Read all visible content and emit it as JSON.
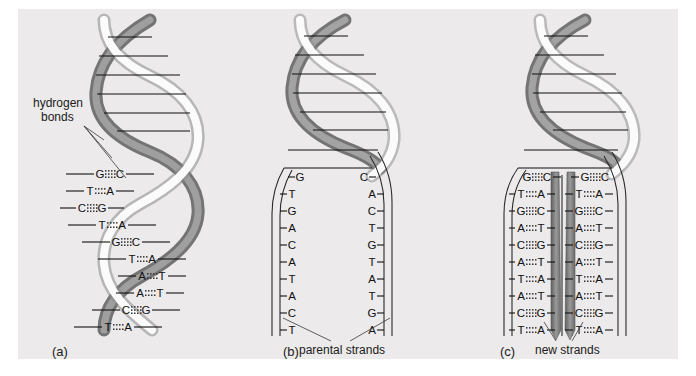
{
  "figure": {
    "background_color": "#ffffff",
    "plate_color": "#eceaea",
    "line_color": "#1a1a1a"
  },
  "annotations": {
    "hydrogen_bonds_line1": "hydrogen",
    "hydrogen_bonds_line2": "bonds",
    "parental_strands": "parental strands",
    "new_strands": "new strands"
  },
  "panels": [
    {
      "id": "a",
      "label": "(a)",
      "state": "intact double helix",
      "base_pairs": [
        {
          "left": "G",
          "right": "C",
          "bonds": 3
        },
        {
          "left": "T",
          "right": "A",
          "bonds": 2
        },
        {
          "left": "C",
          "right": "G",
          "bonds": 3
        },
        {
          "left": "T",
          "right": "A",
          "bonds": 2
        },
        {
          "left": "G",
          "right": "C",
          "bonds": 3
        },
        {
          "left": "T",
          "right": "A",
          "bonds": 2
        },
        {
          "left": "A",
          "right": "T",
          "bonds": 2
        },
        {
          "left": "A",
          "right": "T",
          "bonds": 2
        },
        {
          "left": "C",
          "right": "G",
          "bonds": 3
        },
        {
          "left": "T",
          "right": "A",
          "bonds": 2
        }
      ]
    },
    {
      "id": "b",
      "label": "(b)",
      "state": "unwound parental strands",
      "left_strand": [
        "G",
        "T",
        "G",
        "A",
        "C",
        "A",
        "T",
        "A",
        "C",
        "T"
      ],
      "right_strand": [
        "C",
        "A",
        "C",
        "T",
        "G",
        "T",
        "A",
        "T",
        "G",
        "A"
      ]
    },
    {
      "id": "c",
      "label": "(c)",
      "state": "two new daughter duplexes",
      "duplex_left": [
        {
          "left": "G",
          "right": "C",
          "bonds": 3
        },
        {
          "left": "T",
          "right": "A",
          "bonds": 2
        },
        {
          "left": "G",
          "right": "C",
          "bonds": 3
        },
        {
          "left": "A",
          "right": "T",
          "bonds": 2
        },
        {
          "left": "C",
          "right": "G",
          "bonds": 3
        },
        {
          "left": "A",
          "right": "T",
          "bonds": 2
        },
        {
          "left": "T",
          "right": "A",
          "bonds": 2
        },
        {
          "left": "A",
          "right": "T",
          "bonds": 2
        },
        {
          "left": "C",
          "right": "G",
          "bonds": 3
        },
        {
          "left": "T",
          "right": "A",
          "bonds": 2
        }
      ],
      "duplex_right": [
        {
          "left": "G",
          "right": "C",
          "bonds": 3
        },
        {
          "left": "T",
          "right": "A",
          "bonds": 2
        },
        {
          "left": "G",
          "right": "C",
          "bonds": 3
        },
        {
          "left": "A",
          "right": "T",
          "bonds": 2
        },
        {
          "left": "C",
          "right": "G",
          "bonds": 3
        },
        {
          "left": "A",
          "right": "T",
          "bonds": 2
        },
        {
          "left": "T",
          "right": "A",
          "bonds": 2
        },
        {
          "left": "A",
          "right": "T",
          "bonds": 2
        },
        {
          "left": "C",
          "right": "G",
          "bonds": 3
        },
        {
          "left": "T",
          "right": "A",
          "bonds": 2
        }
      ]
    }
  ]
}
